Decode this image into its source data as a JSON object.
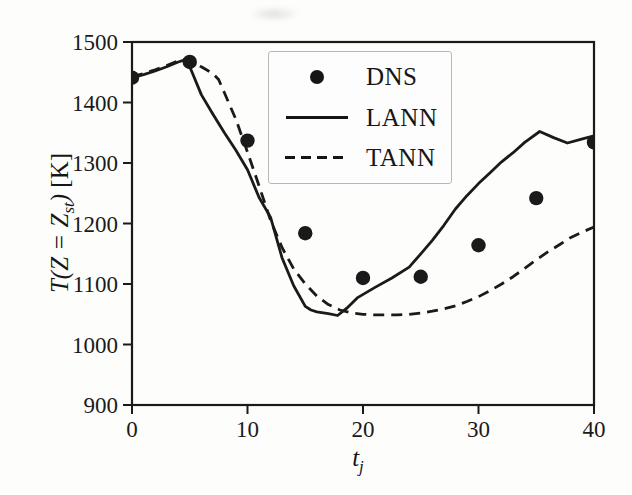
{
  "figure": {
    "paper_color": "#fdfdfc",
    "ink_color": "#1a1a1a",
    "legend_border_color": "#b8b8b8"
  },
  "chart_data": {
    "type": "line",
    "title": "",
    "xlabel": "t_j",
    "ylabel": "T(Z = Z_st) [K]",
    "xlabel_parts": {
      "main": "t",
      "sub": "j"
    },
    "ylabel_parts": {
      "main": "T(Z = Z",
      "sub": "st",
      "close": ")",
      "unit": " [K]"
    },
    "xlim": [
      0,
      40
    ],
    "ylim": [
      900,
      1500
    ],
    "xticks": [
      0,
      10,
      20,
      30,
      40
    ],
    "yticks": [
      900,
      1000,
      1100,
      1200,
      1300,
      1400,
      1500
    ],
    "grid": false,
    "legend": {
      "position": "upper-center-inside",
      "items": [
        "DNS",
        "LANN",
        "TANN"
      ]
    },
    "series": [
      {
        "name": "DNS",
        "type": "scatter",
        "marker": "filled-circle",
        "x": [
          0,
          5,
          10,
          15,
          20,
          25,
          30,
          35,
          40
        ],
        "y": [
          1441,
          1467,
          1337,
          1184,
          1110,
          1112,
          1164,
          1242,
          1334
        ]
      },
      {
        "name": "LANN",
        "type": "line",
        "linestyle": "solid",
        "x": [
          0,
          1,
          2,
          3,
          4,
          4.5,
          5,
          6,
          7,
          8,
          9,
          10,
          11,
          12,
          13,
          14,
          15,
          15.5,
          16,
          17,
          17.8,
          18.6,
          19.5,
          21,
          22.5,
          24,
          25,
          26,
          27,
          28,
          29,
          30,
          31,
          32,
          33,
          34,
          35.3,
          36.5,
          37.7,
          39,
          40
        ],
        "y": [
          1441,
          1446,
          1452,
          1459,
          1467,
          1470,
          1459,
          1413,
          1381,
          1350,
          1321,
          1289,
          1243,
          1210,
          1143,
          1097,
          1063,
          1057,
          1054,
          1051,
          1048,
          1060,
          1077,
          1094,
          1110,
          1128,
          1150,
          1172,
          1197,
          1224,
          1246,
          1266,
          1284,
          1302,
          1317,
          1334,
          1352,
          1342,
          1333,
          1340,
          1345
        ]
      },
      {
        "name": "TANN",
        "type": "line",
        "linestyle": "dashed",
        "x": [
          0,
          1,
          2,
          3,
          4,
          4.5,
          5,
          6,
          7,
          7.5,
          8,
          9,
          10,
          11,
          12,
          13,
          14,
          15,
          16,
          17,
          18,
          19,
          20,
          21,
          22,
          23,
          24,
          25,
          26,
          27,
          28,
          29,
          30,
          31,
          32,
          33,
          34,
          35,
          36,
          37,
          38,
          39,
          40
        ],
        "y": [
          1443,
          1448,
          1454,
          1461,
          1469,
          1471,
          1466,
          1459,
          1448,
          1438,
          1416,
          1372,
          1318,
          1262,
          1205,
          1160,
          1125,
          1100,
          1080,
          1066,
          1057,
          1052,
          1050,
          1049,
          1049,
          1049,
          1050,
          1052,
          1055,
          1059,
          1064,
          1071,
          1079,
          1089,
          1100,
          1112,
          1126,
          1140,
          1153,
          1165,
          1177,
          1186,
          1194
        ]
      }
    ]
  }
}
